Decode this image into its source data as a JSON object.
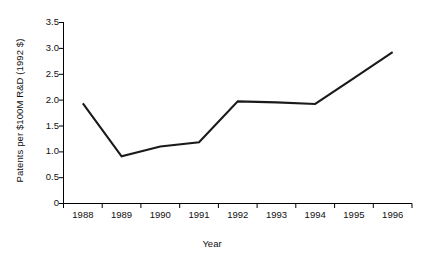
{
  "chart_data": {
    "type": "line",
    "title": "",
    "subtitle": "",
    "xlabel": "Year",
    "ylabel": "Patents per $100M R&D (1992 $)",
    "categories": [
      "1988",
      "1989",
      "1990",
      "1991",
      "1992",
      "1993",
      "1994",
      "1995",
      "1996"
    ],
    "x": [
      1988,
      1989,
      1990,
      1991,
      1992,
      1993,
      1994,
      1995,
      1996
    ],
    "values": [
      1.93,
      0.91,
      1.1,
      1.18,
      1.97,
      1.95,
      1.92,
      2.42,
      2.92
    ],
    "series": [
      {
        "name": "Patents per $100M R&D",
        "values": [
          1.93,
          0.91,
          1.1,
          1.18,
          1.97,
          1.95,
          1.92,
          2.42,
          2.92
        ],
        "color": "#1a1a1a"
      }
    ],
    "ylim": [
      0,
      3.5
    ],
    "yticks": [
      0,
      0.5,
      1.0,
      1.5,
      2.0,
      2.5,
      3.0,
      3.5
    ],
    "ytick_labels": [
      "0",
      "0.5",
      "1.0",
      "1.5",
      "2.0",
      "2.5",
      "3.0",
      "3.5"
    ],
    "xtick_labels": [
      "1988",
      "1989",
      "1990",
      "1991",
      "1992",
      "1993",
      "1994",
      "1995",
      "1996"
    ],
    "grid": false,
    "legend": false,
    "legend_position": "none",
    "line_color": "#1a1a1a",
    "axis_color": "#000000",
    "background_color": "#ffffff",
    "markers": false
  },
  "axes": {
    "y_axis_title": "Patents per $100M R&D (1992 $)",
    "x_axis_title": "Year"
  }
}
